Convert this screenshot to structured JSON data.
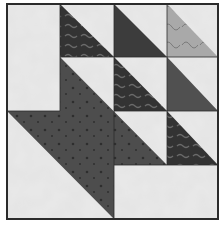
{
  "image": {
    "title": "Quilt block",
    "description": "4x4 patchwork quilt block with half-square triangles and a large dark arrow shape",
    "colors": {
      "background_fabric": "#e4e4e4",
      "dark_fabric": "#4a4a4a",
      "patterned_dark_fabric": "#3a3a3a",
      "light_patterned_fabric": "#a8a8a8",
      "medium_dark_fabric": "#555555",
      "outline": "#2b2b2b"
    },
    "grid": {
      "rows": 4,
      "columns": 4
    },
    "pieces": [
      {
        "name": "left-light-rectangle",
        "fabric": "background_fabric"
      },
      {
        "name": "hst-top-col2",
        "fabric": "patterned_dark_fabric"
      },
      {
        "name": "hst-top-col3",
        "fabric": "patterned_dark_fabric"
      },
      {
        "name": "hst-top-col4",
        "fabric": "light_patterned_fabric"
      },
      {
        "name": "hst-row2-col3",
        "fabric": "patterned_dark_fabric"
      },
      {
        "name": "hst-row2-col4",
        "fabric": "medium_dark_fabric"
      },
      {
        "name": "hst-row3-col4",
        "fabric": "patterned_dark_fabric"
      },
      {
        "name": "large-dark-arrow",
        "fabric": "dark_fabric"
      },
      {
        "name": "bottom-light-rectangle",
        "fabric": "background_fabric"
      }
    ]
  }
}
